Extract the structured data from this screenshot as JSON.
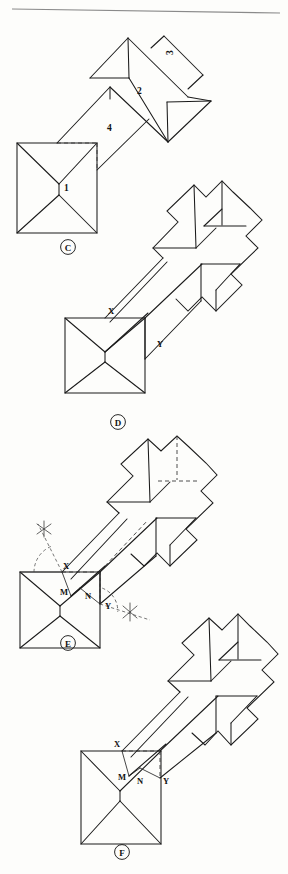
{
  "page": {
    "width": 288,
    "height": 874,
    "background": "#fdfdfb",
    "ink_color": "#1b1b1b",
    "hidden_line_color": "#3a3a3a",
    "construction_color": "#4a4a4a"
  },
  "header_rule": {
    "present": true
  },
  "figures": [
    {
      "id": "figure-c",
      "label": "C",
      "caption_position": {
        "x": 68,
        "y": 250
      },
      "annotations": [
        {
          "name": "face-label-1",
          "text": "1",
          "x": 64,
          "y": 188
        },
        {
          "name": "face-label-2",
          "text": "2",
          "x": 137,
          "y": 91
        },
        {
          "name": "face-label-3",
          "text": "3",
          "x": 173,
          "y": 52
        },
        {
          "name": "face-label-4",
          "text": "4",
          "x": 107,
          "y": 128
        }
      ]
    },
    {
      "id": "figure-d",
      "label": "D",
      "caption_position": {
        "x": 118,
        "y": 400
      },
      "annotations": [
        {
          "name": "point-label-x",
          "text": "X",
          "x": 111,
          "y": 311
        },
        {
          "name": "point-label-y",
          "text": "Y",
          "x": 158,
          "y": 344
        }
      ]
    },
    {
      "id": "figure-e",
      "label": "E",
      "caption_position": {
        "x": 68,
        "y": 645
      },
      "annotations": [
        {
          "name": "point-label-x",
          "text": "X",
          "x": 66,
          "y": 566
        },
        {
          "name": "point-label-m",
          "text": "M",
          "x": 63,
          "y": 592
        },
        {
          "name": "point-label-n",
          "text": "N",
          "x": 88,
          "y": 596
        },
        {
          "name": "point-label-y",
          "text": "Y",
          "x": 110,
          "y": 604
        }
      ],
      "construction": {
        "description": "angle bisector arcs and intersection crosses at X and Y",
        "arcs": 2,
        "crosses": 2
      }
    },
    {
      "id": "figure-f",
      "label": "F",
      "caption_position": {
        "x": 122,
        "y": 855
      },
      "annotations": [
        {
          "name": "point-label-x",
          "text": "X",
          "x": 117,
          "y": 743
        },
        {
          "name": "point-label-m",
          "text": "M",
          "x": 122,
          "y": 776
        },
        {
          "name": "point-label-n",
          "text": "N",
          "x": 140,
          "y": 780
        },
        {
          "name": "point-label-y",
          "text": "Y",
          "x": 163,
          "y": 780
        }
      ]
    }
  ]
}
